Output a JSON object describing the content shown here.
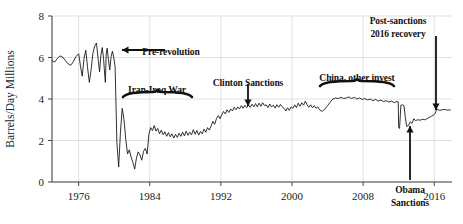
{
  "chart_data": {
    "type": "line",
    "title": "",
    "xlabel": "",
    "ylabel": "Barrels/Day Millions",
    "xlim": [
      1973,
      2018
    ],
    "ylim": [
      0,
      8
    ],
    "xticks": [
      1976,
      1984,
      1992,
      2000,
      2008,
      2016
    ],
    "yticks": [
      0,
      2,
      4,
      6,
      8
    ],
    "grid": true,
    "legend": "none",
    "line_color": "#1a1a1a",
    "series": [
      {
        "name": "Iran crude oil production",
        "x": [
          1973.0,
          1973.3,
          1973.6,
          1973.9,
          1974.2,
          1974.5,
          1974.8,
          1975.1,
          1975.4,
          1975.7,
          1976.0,
          1976.2,
          1976.4,
          1976.6,
          1976.8,
          1977.0,
          1977.2,
          1977.4,
          1977.6,
          1977.8,
          1978.0,
          1978.2,
          1978.35,
          1978.5,
          1978.65,
          1978.8,
          1978.9,
          1979.0,
          1979.1,
          1979.2,
          1979.35,
          1979.5,
          1979.65,
          1979.8,
          1979.95,
          1980.1,
          1980.3,
          1980.5,
          1980.7,
          1980.9,
          1981.1,
          1981.3,
          1981.5,
          1981.7,
          1981.9,
          1982.1,
          1982.3,
          1982.5,
          1982.7,
          1982.9,
          1983.1,
          1983.3,
          1983.5,
          1983.7,
          1983.9,
          1984.1,
          1984.3,
          1984.5,
          1984.7,
          1984.9,
          1985.1,
          1985.3,
          1985.5,
          1985.7,
          1985.9,
          1986.1,
          1986.3,
          1986.5,
          1986.7,
          1986.9,
          1987.1,
          1987.3,
          1987.5,
          1987.7,
          1987.9,
          1988.1,
          1988.3,
          1988.5,
          1988.7,
          1988.9,
          1989.1,
          1989.3,
          1989.5,
          1989.7,
          1989.9,
          1990.1,
          1990.3,
          1990.5,
          1990.7,
          1990.9,
          1991.1,
          1991.3,
          1991.5,
          1991.7,
          1991.9,
          1992.1,
          1992.3,
          1992.5,
          1992.7,
          1992.9,
          1993.1,
          1993.3,
          1993.5,
          1993.7,
          1993.9,
          1994.1,
          1994.3,
          1994.5,
          1994.7,
          1994.9,
          1995.1,
          1995.3,
          1995.5,
          1995.7,
          1995.9,
          1996.1,
          1996.3,
          1996.5,
          1996.7,
          1996.9,
          1997.1,
          1997.3,
          1997.5,
          1997.7,
          1997.9,
          1998.1,
          1998.3,
          1998.5,
          1998.7,
          1998.9,
          1999.1,
          1999.3,
          1999.5,
          1999.7,
          1999.9,
          2000.1,
          2000.3,
          2000.5,
          2000.7,
          2000.9,
          2001.1,
          2001.3,
          2001.5,
          2001.7,
          2001.9,
          2002.1,
          2002.3,
          2002.5,
          2002.7,
          2002.9,
          2003.1,
          2003.4,
          2003.7,
          2004.0,
          2004.3,
          2004.6,
          2004.9,
          2005.2,
          2005.5,
          2005.8,
          2006.1,
          2006.4,
          2006.7,
          2007.0,
          2007.3,
          2007.6,
          2007.9,
          2008.2,
          2008.5,
          2008.8,
          2009.1,
          2009.4,
          2009.7,
          2010.0,
          2010.3,
          2010.6,
          2010.9,
          2011.2,
          2011.5,
          2011.8,
          2011.95,
          2012.0,
          2012.1,
          2012.25,
          2012.4,
          2012.5,
          2012.6,
          2012.75,
          2012.9,
          2013.1,
          2013.3,
          2013.5,
          2013.7,
          2013.9,
          2014.1,
          2014.4,
          2014.7,
          2015.0,
          2015.3,
          2015.6,
          2015.9,
          2016.1,
          2016.3,
          2016.6,
          2016.9,
          2017.2,
          2017.5,
          2017.8
        ],
        "y": [
          5.85,
          5.78,
          5.95,
          6.08,
          6.02,
          5.86,
          5.7,
          5.62,
          5.8,
          6.05,
          6.18,
          5.6,
          5.1,
          5.95,
          6.35,
          5.52,
          4.8,
          5.42,
          6.2,
          6.55,
          6.7,
          5.9,
          5.3,
          6.1,
          6.48,
          5.95,
          5.35,
          4.8,
          6.15,
          6.45,
          5.9,
          5.4,
          6.05,
          6.3,
          6.0,
          5.55,
          1.9,
          0.72,
          2.4,
          3.55,
          3.0,
          2.05,
          1.35,
          1.55,
          1.2,
          0.95,
          0.62,
          1.15,
          1.45,
          1.3,
          1.05,
          1.48,
          1.62,
          1.35,
          2.3,
          2.62,
          2.48,
          2.72,
          2.45,
          2.58,
          2.32,
          2.5,
          2.28,
          2.42,
          2.2,
          2.38,
          2.18,
          2.32,
          2.12,
          2.3,
          2.15,
          2.35,
          2.2,
          2.4,
          2.22,
          2.45,
          2.25,
          2.4,
          2.28,
          2.52,
          2.3,
          2.48,
          2.26,
          2.44,
          2.32,
          2.55,
          2.4,
          2.62,
          2.5,
          2.7,
          2.92,
          2.78,
          3.05,
          3.2,
          3.05,
          3.25,
          3.4,
          3.28,
          3.48,
          3.35,
          3.52,
          3.42,
          3.6,
          3.48,
          3.62,
          3.52,
          3.68,
          3.55,
          3.7,
          3.58,
          3.72,
          3.6,
          3.75,
          3.62,
          3.78,
          3.62,
          3.8,
          3.65,
          3.82,
          3.68,
          3.72,
          3.58,
          3.76,
          3.62,
          3.7,
          3.56,
          3.72,
          3.6,
          3.74,
          3.62,
          3.55,
          3.42,
          3.58,
          3.45,
          3.62,
          3.55,
          3.72,
          3.58,
          3.8,
          3.65,
          3.82,
          3.7,
          3.9,
          3.72,
          3.6,
          3.72,
          3.58,
          3.68,
          3.55,
          3.62,
          3.48,
          3.4,
          3.52,
          3.68,
          3.85,
          4.0,
          4.05,
          4.02,
          4.08,
          4.02,
          4.05,
          4.1,
          4.02,
          4.08,
          4.0,
          4.05,
          3.98,
          4.02,
          3.95,
          4.0,
          3.92,
          3.98,
          3.9,
          3.95,
          3.88,
          3.92,
          3.85,
          3.9,
          3.82,
          3.88,
          3.86,
          2.62,
          2.58,
          3.7,
          3.72,
          3.7,
          3.68,
          3.1,
          2.68,
          2.72,
          2.9,
          2.82,
          3.05,
          2.95,
          3.0,
          2.98,
          3.02,
          3.0,
          3.08,
          3.15,
          3.22,
          3.3,
          3.52,
          3.45,
          3.48,
          3.5,
          3.46,
          3.48
        ]
      }
    ],
    "annotations": [
      {
        "name": "pre-revolution",
        "label": "Pre-revolution",
        "marker": "arrow-left",
        "text_x": 171,
        "text_y": 47,
        "arrow_x1": 165,
        "arrow_y1": 50,
        "arrow_x2": 122,
        "arrow_y2": 50
      },
      {
        "name": "iran-iraq-war",
        "label": "Iran-Iraq War",
        "marker": "brace-under",
        "text_x": 157,
        "text_y": 85,
        "brace_x1": 123,
        "brace_x2": 192,
        "brace_y": 97
      },
      {
        "name": "clinton-sanctions",
        "label": "Clinton Sanctions",
        "marker": "arrow-down",
        "text_x": 248,
        "text_y": 78,
        "arrow_x1": 248,
        "arrow_y1": 84,
        "arrow_x2": 248,
        "arrow_y2": 106
      },
      {
        "name": "china-other-invest",
        "label": "China, other invest",
        "marker": "brace-under",
        "text_x": 357,
        "text_y": 73,
        "brace_x1": 320,
        "brace_x2": 394,
        "brace_y": 86
      },
      {
        "name": "post-sanctions-recovery",
        "label_line1": "Post-sanctions",
        "label_line2": "2016 recovery",
        "marker": "arrow-down",
        "text_x": 398,
        "text_y": 16,
        "arrow_x1": 436,
        "arrow_y1": 36,
        "arrow_x2": 436,
        "arrow_y2": 110
      },
      {
        "name": "obama-sanctions",
        "label_line1": "Obama",
        "label_line2": "Sanctions",
        "marker": "arrow-up",
        "text_x": 410,
        "text_y": 185,
        "arrow_x1": 410,
        "arrow_y1": 180,
        "arrow_x2": 410,
        "arrow_y2": 126
      }
    ]
  }
}
